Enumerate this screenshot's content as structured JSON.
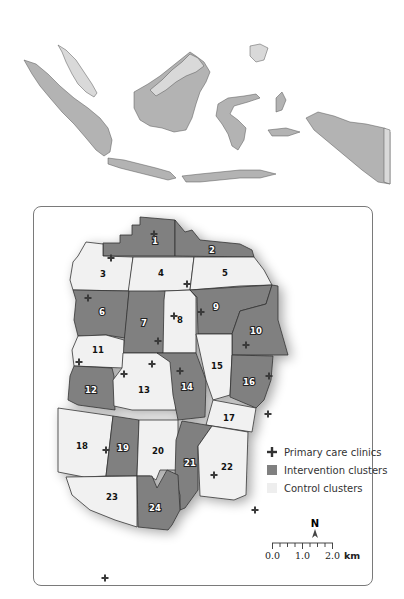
{
  "colors": {
    "intervention": "#808080",
    "control": "#f1f1f1",
    "border": "#333333",
    "clinic": "#3a3a3a",
    "overview_land": "#b3b3b3",
    "overview_light": "#d9d9d9",
    "panel_border": "#7a7a7a"
  },
  "overview_map": {
    "subject": "Indonesia"
  },
  "clusters": [
    {
      "id": "1",
      "type": "intervention"
    },
    {
      "id": "2",
      "type": "intervention"
    },
    {
      "id": "3",
      "type": "control"
    },
    {
      "id": "4",
      "type": "control"
    },
    {
      "id": "5",
      "type": "control"
    },
    {
      "id": "6",
      "type": "intervention"
    },
    {
      "id": "7",
      "type": "intervention"
    },
    {
      "id": "8",
      "type": "control"
    },
    {
      "id": "9",
      "type": "intervention"
    },
    {
      "id": "10",
      "type": "intervention"
    },
    {
      "id": "11",
      "type": "control"
    },
    {
      "id": "12",
      "type": "intervention"
    },
    {
      "id": "13",
      "type": "control"
    },
    {
      "id": "14",
      "type": "intervention"
    },
    {
      "id": "15",
      "type": "control"
    },
    {
      "id": "16",
      "type": "intervention"
    },
    {
      "id": "17",
      "type": "control"
    },
    {
      "id": "18",
      "type": "control"
    },
    {
      "id": "19",
      "type": "intervention"
    },
    {
      "id": "20",
      "type": "control"
    },
    {
      "id": "21",
      "type": "intervention"
    },
    {
      "id": "22",
      "type": "control"
    },
    {
      "id": "23",
      "type": "control"
    },
    {
      "id": "24",
      "type": "intervention"
    }
  ],
  "legend": {
    "items": [
      {
        "symbol": "cross",
        "label": "Primary care clinics"
      },
      {
        "symbol": "square-dark",
        "label": "Intervention clusters"
      },
      {
        "symbol": "square-light",
        "label": "Control clusters"
      }
    ]
  },
  "north_arrow": {
    "label": "N"
  },
  "scale_bar": {
    "ticks": [
      "0.0",
      "1.0",
      "2.0"
    ],
    "unit": "km"
  }
}
